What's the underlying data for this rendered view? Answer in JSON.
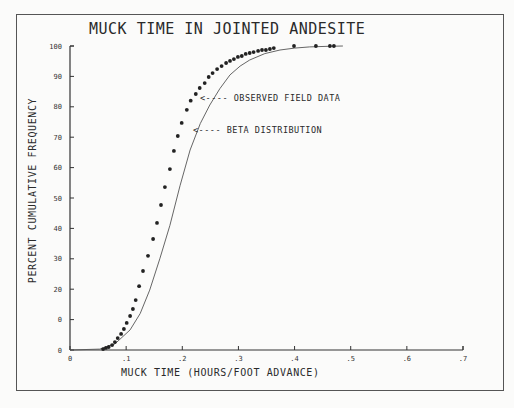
{
  "chart_data": {
    "type": "scatter",
    "title": "MUCK TIME IN JOINTED ANDESITE",
    "xlabel": "MUCK TIME (HOURS/FOOT ADVANCE)",
    "ylabel": "PERCENT CUMULATIVE FREQUENCY",
    "xlim": [
      0,
      0.7
    ],
    "ylim": [
      0,
      100
    ],
    "x_ticks": [
      "0",
      ".1",
      ".2",
      ".3",
      ".4",
      ".5",
      ".6",
      ".7"
    ],
    "x_tick_values": [
      0,
      0.1,
      0.2,
      0.3,
      0.4,
      0.5,
      0.6,
      0.7
    ],
    "y_ticks": [
      "0",
      "0",
      "20",
      "30",
      "40",
      "50",
      "60",
      "70",
      "80",
      "90",
      "100"
    ],
    "y_tick_values": [
      0,
      10,
      20,
      30,
      40,
      50,
      60,
      70,
      80,
      90,
      100
    ],
    "grid": false,
    "legend_position": "inline annotations, upper middle",
    "series": [
      {
        "name": "OBSERVED FIELD DATA",
        "style": "dots",
        "x": [
          0.059,
          0.064,
          0.069,
          0.075,
          0.08,
          0.085,
          0.091,
          0.096,
          0.101,
          0.107,
          0.112,
          0.117,
          0.123,
          0.13,
          0.139,
          0.148,
          0.155,
          0.162,
          0.169,
          0.178,
          0.185,
          0.192,
          0.199,
          0.208,
          0.215,
          0.224,
          0.231,
          0.24,
          0.247,
          0.254,
          0.262,
          0.27,
          0.278,
          0.285,
          0.292,
          0.299,
          0.306,
          0.313,
          0.32,
          0.327,
          0.335,
          0.342,
          0.349,
          0.356,
          0.363,
          0.399,
          0.438,
          0.463,
          0.47
        ],
        "y": [
          0.3,
          0.7,
          1,
          1.6,
          2.6,
          3.9,
          5.3,
          6.9,
          8.9,
          11.2,
          13.5,
          16.4,
          21,
          26,
          31,
          36.5,
          41.8,
          47.7,
          53.6,
          59.5,
          65.5,
          70.4,
          74.7,
          79,
          82,
          84.2,
          86.2,
          87.8,
          89.8,
          91.1,
          92.4,
          93.4,
          94.4,
          95.1,
          95.7,
          96.4,
          96.7,
          97.4,
          97.7,
          98,
          98.4,
          98.7,
          98.7,
          99,
          99.3,
          100,
          100,
          100,
          100
        ]
      },
      {
        "name": "BETA DISTRIBUTION",
        "style": "line",
        "x": [
          0,
          0.053,
          0.08,
          0.107,
          0.125,
          0.142,
          0.16,
          0.178,
          0.196,
          0.214,
          0.232,
          0.249,
          0.267,
          0.285,
          0.303,
          0.32,
          0.347,
          0.374,
          0.4,
          0.427,
          0.46,
          0.486
        ],
        "y": [
          0,
          0.3,
          2,
          6.6,
          12,
          19.7,
          30,
          41,
          54,
          65.8,
          74.5,
          80.6,
          86,
          90.5,
          93.4,
          95.4,
          97.5,
          98.7,
          99.3,
          99.7,
          99.9,
          100
        ]
      }
    ],
    "annotations": [
      {
        "text": "<---- OBSERVED FIELD DATA",
        "points_to": [
          0.23,
          84
        ]
      },
      {
        "text": "<---- BETA DISTRIBUTION",
        "points_to": [
          0.225,
          72
        ]
      }
    ]
  }
}
